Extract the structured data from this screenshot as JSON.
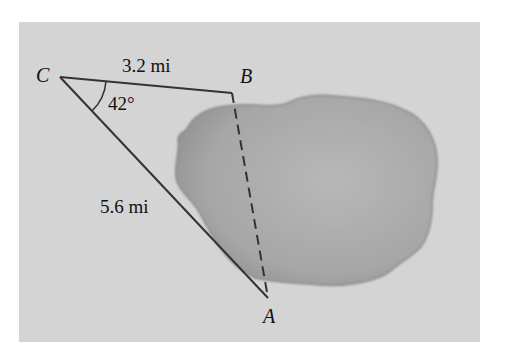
{
  "diagram": {
    "points": {
      "C": {
        "label": "C"
      },
      "B": {
        "label": "B"
      },
      "A": {
        "label": "A"
      }
    },
    "sides": {
      "CB": {
        "length_label": "3.2 mi"
      },
      "CA": {
        "length_label": "5.6 mi"
      },
      "AB": {
        "style": "dashed",
        "length_label": ""
      }
    },
    "angle_C": {
      "label": "42°"
    },
    "colors": {
      "background_panel": "#d4d4d4",
      "lake_fill": "#a6a6a6",
      "lake_edge": "#8a8a8a",
      "lines": "#333333"
    }
  }
}
